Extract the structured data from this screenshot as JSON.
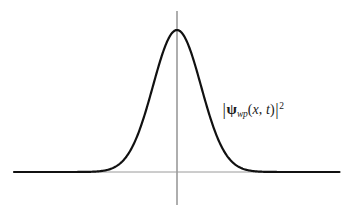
{
  "figure": {
    "background_color": "#ffffff",
    "width": 347,
    "height": 218
  },
  "axes": {
    "color": "#9a9a9a",
    "x_axis": {
      "name": "horizontal-axis",
      "x_start": 14,
      "x_end": 340,
      "y": 172,
      "stroke_width": 1
    },
    "y_axis": {
      "name": "vertical-axis",
      "x": 177,
      "y_top": 11,
      "y_bottom": 205,
      "stroke_width": 1.6
    }
  },
  "label": {
    "text": "|ψ_wp(x, t)|²",
    "bar_open": "|",
    "psi": "ψ",
    "subscript": "wp",
    "paren_open": "(",
    "arg_x": "x",
    "comma": ", ",
    "arg_t": "t",
    "paren_close": ")",
    "bar_close": "|",
    "exponent": "2",
    "color": "#1a1a1a",
    "x": 222,
    "y": 101
  },
  "chart_data": {
    "type": "line",
    "title": "",
    "xlabel": "",
    "ylabel": "",
    "curve_name": "gaussian-probability-density",
    "curve_color": "#111111",
    "curve_stroke_width": 2.2,
    "peak": {
      "x": 177,
      "y": 30
    },
    "baseline_y": 172,
    "amplitude_px": 142,
    "center_px": 177,
    "sigma_px": 24,
    "hwhm_px": 28,
    "x_domain_px": [
      14,
      340
    ],
    "grid": false,
    "legend": false,
    "x": [
      14,
      30,
      46,
      62,
      78,
      90,
      100,
      110,
      118,
      126,
      134,
      142,
      150,
      158,
      164,
      170,
      177,
      184,
      190,
      196,
      204,
      212,
      220,
      228,
      236,
      246,
      256,
      268,
      284,
      302,
      320,
      340
    ],
    "y": [
      172,
      172,
      172,
      171.8,
      171.2,
      170.4,
      169.2,
      166.8,
      163.6,
      158.6,
      151.4,
      141.2,
      127.2,
      108.8,
      92.0,
      73.0,
      30.0,
      73.0,
      92.0,
      108.8,
      127.2,
      141.2,
      151.4,
      158.6,
      163.6,
      168.0,
      170.2,
      171.4,
      171.9,
      172,
      172,
      172
    ]
  }
}
